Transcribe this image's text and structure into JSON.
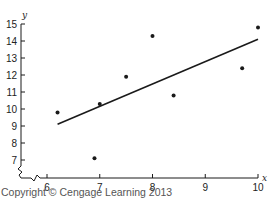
{
  "chart_data": {
    "type": "scatter",
    "title": "",
    "xlabel": "x",
    "ylabel": "y",
    "xlim": [
      6,
      10
    ],
    "ylim": [
      7,
      15
    ],
    "axis_break": "both axes broken near origin (zigzag)",
    "grid": false,
    "legend": null,
    "x_ticks": [
      6,
      7,
      8,
      9,
      10
    ],
    "y_ticks": [
      7,
      8,
      9,
      10,
      11,
      12,
      13,
      14,
      15
    ],
    "series": [
      {
        "name": "data points",
        "x": [
          6.2,
          6.9,
          7.0,
          7.5,
          8.0,
          8.4,
          9.7,
          10.0
        ],
        "y": [
          9.8,
          7.1,
          10.3,
          11.9,
          14.3,
          10.8,
          12.4,
          14.8
        ]
      }
    ],
    "regression_line": {
      "x_start": 6.2,
      "y_start": 9.1,
      "x_end": 10.0,
      "y_end": 14.1
    }
  },
  "footer": {
    "copyright": "Copyright © Cengage Learning 2013"
  },
  "colors": {
    "ink": "#1a1a1a",
    "text": "#222222",
    "copyright": "#555555",
    "background": "#ffffff"
  }
}
